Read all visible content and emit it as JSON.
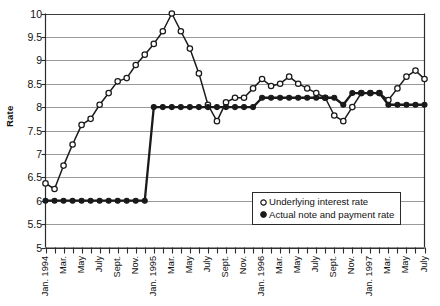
{
  "chart_data": {
    "type": "line",
    "title": "",
    "xlabel": "",
    "ylabel": "Rate",
    "ylim": [
      5,
      10
    ],
    "ytick_step": 0.5,
    "yticks": [
      "10",
      "9.5",
      "9",
      "8.5",
      "8",
      "7.5",
      "7",
      "6.5",
      "6",
      "5.5",
      "5"
    ],
    "grid": "horizontal",
    "legend_position": "bottom-right",
    "x_tick_labels": [
      "Jan. 1994",
      "",
      "Mar.",
      "",
      "May",
      "",
      "July",
      "",
      "Sept.",
      "",
      "Nov.",
      "",
      "Jan. 1995",
      "",
      "Mar.",
      "",
      "May",
      "",
      "July",
      "",
      "Sept.",
      "",
      "Nov.",
      "",
      "Jan. 1996",
      "",
      "Mar.",
      "",
      "May",
      "",
      "July",
      "",
      "Sept.",
      "",
      "Nov.",
      "",
      "Jan. 1997",
      "",
      "Mar.",
      "",
      "May",
      "",
      "July"
    ],
    "x": [
      "Jan. 1994",
      "Feb. 1994",
      "Mar. 1994",
      "Apr. 1994",
      "May 1994",
      "June 1994",
      "July 1994",
      "Aug. 1994",
      "Sept. 1994",
      "Oct. 1994",
      "Nov. 1994",
      "Dec. 1994",
      "Jan. 1995",
      "Feb. 1995",
      "Mar. 1995",
      "Apr. 1995",
      "May 1995",
      "June 1995",
      "July 1995",
      "Aug. 1995",
      "Sept. 1995",
      "Oct. 1995",
      "Nov. 1995",
      "Dec. 1995",
      "Jan. 1996",
      "Feb. 1996",
      "Mar. 1996",
      "Apr. 1996",
      "May 1996",
      "June 1996",
      "July 1996",
      "Aug. 1996",
      "Sept. 1996",
      "Oct. 1996",
      "Nov. 1996",
      "Dec. 1996",
      "Jan. 1997",
      "Feb. 1997",
      "Mar. 1997",
      "Apr. 1997",
      "May 1997",
      "June 1997",
      "July 1997"
    ],
    "series": [
      {
        "name": "Underlying interest rate",
        "marker": "open-circle",
        "color": "#1a1a1a",
        "values": [
          6.37,
          6.25,
          6.75,
          7.2,
          7.62,
          7.75,
          8.05,
          8.3,
          8.55,
          8.62,
          8.9,
          9.12,
          9.35,
          9.62,
          10.0,
          9.62,
          9.25,
          8.72,
          8.05,
          7.7,
          8.1,
          8.2,
          8.2,
          8.4,
          8.6,
          8.45,
          8.5,
          8.65,
          8.5,
          8.4,
          8.3,
          8.2,
          7.82,
          7.7,
          8.0,
          8.3,
          8.3,
          8.3,
          8.15,
          8.4,
          8.65,
          8.78,
          8.6
        ]
      },
      {
        "name": "Actual note and payment rate",
        "marker": "filled-circle",
        "color": "#1a1a1a",
        "values": [
          6.0,
          6.0,
          6.0,
          6.0,
          6.0,
          6.0,
          6.0,
          6.0,
          6.0,
          6.0,
          6.0,
          6.0,
          8.0,
          8.0,
          8.0,
          8.0,
          8.0,
          8.0,
          8.0,
          8.0,
          8.0,
          8.0,
          8.0,
          8.0,
          8.2,
          8.2,
          8.2,
          8.2,
          8.2,
          8.2,
          8.2,
          8.2,
          8.2,
          8.05,
          8.3,
          8.3,
          8.3,
          8.3,
          8.05,
          8.05,
          8.05,
          8.05,
          8.05
        ]
      }
    ],
    "legend": [
      {
        "label": "Underlying interest rate",
        "marker": "open-circle"
      },
      {
        "label": "Actual note and payment rate",
        "marker": "filled-circle"
      }
    ]
  }
}
